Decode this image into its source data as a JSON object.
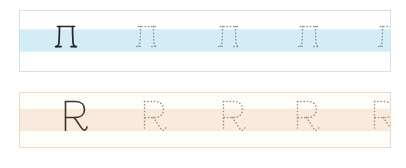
{
  "sheet": {
    "title": "Letter tracing practice worksheet",
    "background_color": "#ffffff",
    "width": 406,
    "height": 168
  },
  "rows": [
    {
      "id": "row-blue",
      "name": "blue-practice-row",
      "letter": "Л",
      "letter_name": "cyrillic-capital-el",
      "script": "Cyrillic",
      "band_color": "#d3edf7",
      "border_color": "#cfe3ef",
      "stroke_color": "#24252a",
      "dot_color": "#7d8fa0",
      "example_count": 1,
      "trace_count": 4,
      "glyphs": [
        {
          "type": "solid",
          "label": "Л",
          "x": 29
        },
        {
          "type": "dotted",
          "label": "Л",
          "x": 110
        },
        {
          "type": "dotted",
          "label": "Л",
          "x": 192
        },
        {
          "type": "dotted",
          "label": "Л",
          "x": 272
        },
        {
          "type": "dotted",
          "label": "Л",
          "x": 352
        }
      ]
    },
    {
      "id": "row-peach",
      "name": "peach-practice-row",
      "letter": "R",
      "letter_name": "latin-capital-r",
      "script": "Latin",
      "band_color": "#faeadb",
      "border_color": "#f0d8c2",
      "stroke_color": "#3a332e",
      "dot_color": "#9e8b78",
      "example_count": 1,
      "trace_count": 4,
      "glyphs": [
        {
          "type": "solid",
          "label": "R",
          "x": 36
        },
        {
          "type": "dotted",
          "label": "R",
          "x": 115
        },
        {
          "type": "dotted",
          "label": "R",
          "x": 194
        },
        {
          "type": "dotted",
          "label": "R",
          "x": 268
        },
        {
          "type": "dotted",
          "label": "R",
          "x": 345
        }
      ]
    }
  ]
}
